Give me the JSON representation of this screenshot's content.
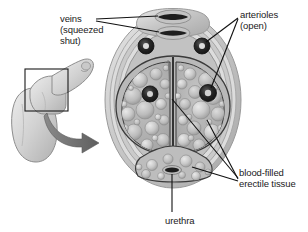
{
  "figure": {
    "background_color": "#ffffff",
    "ink_color": "#1a1a1a"
  },
  "labels": {
    "veins": "veins\n(squeezed\nshut)",
    "arterioles": "arterioles\n(open)",
    "erectile_tissue": "blood-filled\nerectile tissue",
    "urethra": "urethra"
  },
  "structures": {
    "outer_fascia": "outer fascial layers",
    "corpus_cavernosum_left": "left corpus cavernosum",
    "corpus_cavernosum_right": "right corpus cavernosum",
    "septum": "median septum",
    "corpus_spongiosum": "corpus spongiosum",
    "deep_dorsal_vein": "deep dorsal vein (flattened)",
    "superficial_dorsal_vein": "superficial dorsal vein (flattened)",
    "arteriole_upper_right": "dorsal arteriole (open)",
    "arteriole_upper_left": "dorsal arteriole (open)",
    "arteriole_deep_right": "deep arteriole (open)",
    "arteriole_deep_left": "deep arteriole (open)",
    "urethral_lumen": "urethral lumen"
  },
  "inset": {
    "organ": "whole organ, erect",
    "selection_box": "magnified region",
    "arrow": "magnification arrow"
  },
  "colors": {
    "tissue_light": "#d8d8d8",
    "tissue_mid": "#b4b4b4",
    "tissue_dark": "#8e8e8e",
    "fascia": "#cfcfcf",
    "vessel_dark": "#242424",
    "line": "#111111",
    "arrow": "#6f6f6f"
  }
}
